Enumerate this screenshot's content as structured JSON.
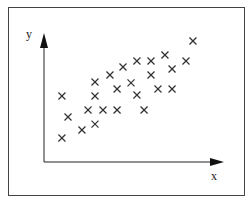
{
  "chart_data": {
    "type": "scatter",
    "title": "",
    "xlabel": "x",
    "ylabel": "y",
    "xlim": [
      0,
      100
    ],
    "ylim": [
      0,
      100
    ],
    "grid": false,
    "legend": "none",
    "marker": "x",
    "tick_labels": false,
    "series": [
      {
        "name": "data",
        "points": [
          {
            "x": 85.6,
            "y": 99.2
          },
          {
            "x": 69.5,
            "y": 87.7
          },
          {
            "x": 45.4,
            "y": 77.9
          },
          {
            "x": 53.4,
            "y": 82.8
          },
          {
            "x": 61.5,
            "y": 82.8
          },
          {
            "x": 81.6,
            "y": 82.8
          },
          {
            "x": 73.6,
            "y": 76.2
          },
          {
            "x": 37.9,
            "y": 71.3
          },
          {
            "x": 61.5,
            "y": 71.3
          },
          {
            "x": 29.3,
            "y": 65.6
          },
          {
            "x": 50.0,
            "y": 64.8
          },
          {
            "x": 42.0,
            "y": 59.8
          },
          {
            "x": 65.5,
            "y": 59.8
          },
          {
            "x": 73.6,
            "y": 59.8
          },
          {
            "x": 10.3,
            "y": 54.1
          },
          {
            "x": 29.3,
            "y": 54.1
          },
          {
            "x": 53.4,
            "y": 54.9
          },
          {
            "x": 13.8,
            "y": 36.9
          },
          {
            "x": 25.3,
            "y": 42.6
          },
          {
            "x": 33.9,
            "y": 42.6
          },
          {
            "x": 42.0,
            "y": 42.6
          },
          {
            "x": 57.5,
            "y": 42.6
          },
          {
            "x": 29.3,
            "y": 31.1
          },
          {
            "x": 21.8,
            "y": 26.2
          },
          {
            "x": 10.3,
            "y": 19.7
          }
        ]
      }
    ]
  },
  "colors": {
    "marker": "#333333",
    "axis": "#222222",
    "frame": "#444444",
    "background": "#ffffff"
  }
}
